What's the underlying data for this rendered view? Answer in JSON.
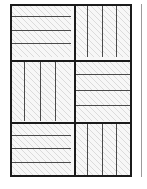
{
  "figure": {
    "name": "parquet-basket-weave-tiling",
    "canvas": {
      "width": 147,
      "height": 189,
      "background": "#ffffff"
    },
    "frame": {
      "x": 10,
      "y": 4,
      "width": 122,
      "height": 173,
      "stroke": "#1b1b1b",
      "stroke_width": 2.2,
      "fill": "#f7f7f7"
    },
    "colors": {
      "outline": "#1b1b1b",
      "plank_seam": "#4a4a4a",
      "plank_fill": "#f7f7f7",
      "hatch": "#c8c8c8",
      "neighbor_rule": "#9b9b9b",
      "page_background": "#ffffff"
    },
    "grid": {
      "column_split_x": 74,
      "row_split_1_y": 60,
      "row_split_2_y": 122,
      "separator_width": 2.2
    },
    "blocks": [
      {
        "id": "block-top-left",
        "label": "Top left block",
        "orientation": "horizontal",
        "plank_count": 4,
        "x": 10,
        "y": 4,
        "width": 64,
        "height": 56
      },
      {
        "id": "block-top-right",
        "label": "Top right block",
        "orientation": "vertical",
        "plank_count": 4,
        "x": 74,
        "y": 4,
        "width": 58,
        "height": 56
      },
      {
        "id": "block-middle-left",
        "label": "Middle left block",
        "orientation": "vertical",
        "plank_count": 4,
        "x": 10,
        "y": 60,
        "width": 64,
        "height": 62
      },
      {
        "id": "block-middle-right",
        "label": "Middle right block",
        "orientation": "horizontal",
        "plank_count": 4,
        "x": 74,
        "y": 60,
        "width": 58,
        "height": 62
      },
      {
        "id": "block-bottom-left",
        "label": "Bottom left block",
        "orientation": "horizontal",
        "plank_count": 4,
        "x": 10,
        "y": 122,
        "width": 64,
        "height": 55
      },
      {
        "id": "block-bottom-right",
        "label": "Bottom right block",
        "orientation": "vertical",
        "plank_count": 4,
        "x": 74,
        "y": 122,
        "width": 58,
        "height": 55
      }
    ],
    "separators": [
      {
        "id": "sep-vertical-center",
        "type": "vertical",
        "x": 73.9,
        "y": 4,
        "length": 173
      },
      {
        "id": "sep-horizontal-upper",
        "type": "horizontal",
        "x": 10,
        "y": 59,
        "length": 122
      },
      {
        "id": "sep-horizontal-lower",
        "type": "horizontal",
        "x": 10,
        "y": 121,
        "length": 122
      }
    ],
    "neighbor_rule": {
      "id": "neighbor-figure-edge",
      "label": "Left edge of adjacent figure",
      "x": 141,
      "y": 4,
      "width": 1.3,
      "height": 173
    }
  }
}
